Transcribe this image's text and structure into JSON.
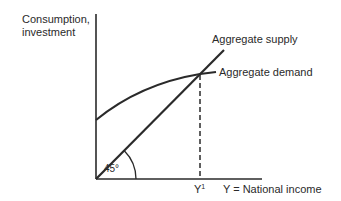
{
  "diagram": {
    "type": "economics-income-determination",
    "y_axis_label_line1": "Consumption,",
    "y_axis_label_line2": "investment",
    "x_axis_label": "Y = National income",
    "equilibrium_label": "Y",
    "equilibrium_superscript": "1",
    "angle_label": "45°",
    "curves": {
      "aggregate_supply": "Aggregate supply",
      "aggregate_demand": "Aggregate demand"
    },
    "line_color": "#2a2a2a"
  }
}
